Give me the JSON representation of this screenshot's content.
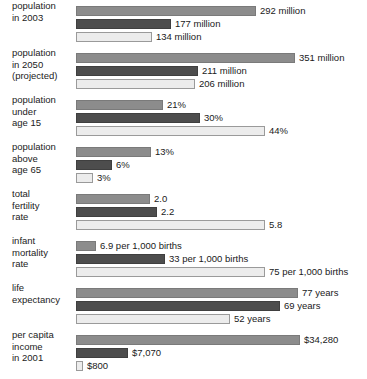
{
  "chart_data": {
    "type": "bar",
    "orientation": "horizontal",
    "title": "",
    "subtitle": "",
    "xlabel": "",
    "ylabel": "",
    "grid": false,
    "legend_position": "none",
    "series_names": [
      "United States",
      "World",
      "Least developed countries"
    ],
    "series_colors": [
      "#8c8c8c",
      "#4d4d4d",
      "#ececec"
    ],
    "categories": [
      "population in 2003",
      "population in 2050 (projected)",
      "population under age 15",
      "population above age 65",
      "total fertility rate",
      "infant mortality rate",
      "life expectancy",
      "per capita income in 2001"
    ],
    "series": [
      {
        "name": "United States",
        "values": [
          292,
          351,
          21,
          13,
          2.0,
          6.9,
          77,
          34280
        ]
      },
      {
        "name": "World",
        "values": [
          177,
          211,
          30,
          6,
          2.2,
          33,
          69,
          7070
        ]
      },
      {
        "name": "Least developed countries",
        "values": [
          134,
          206,
          44,
          3,
          5.8,
          75,
          52,
          800
        ]
      }
    ],
    "groups": [
      {
        "label_lines": [
          "population",
          "in 2003"
        ],
        "bars": [
          {
            "series": 0,
            "value": 292,
            "value_label": "292 million",
            "width_px": 180
          },
          {
            "series": 1,
            "value": 177,
            "value_label": "177 million",
            "width_px": 95
          },
          {
            "series": 2,
            "value": 134,
            "value_label": "134 million",
            "width_px": 76
          }
        ]
      },
      {
        "label_lines": [
          "population",
          "in 2050",
          "(projected)"
        ],
        "bars": [
          {
            "series": 0,
            "value": 351,
            "value_label": "351 million",
            "width_px": 219
          },
          {
            "series": 1,
            "value": 211,
            "value_label": "211 million",
            "width_px": 122
          },
          {
            "series": 2,
            "value": 206,
            "value_label": "206 million",
            "width_px": 119
          }
        ]
      },
      {
        "label_lines": [
          "population",
          "under",
          "age 15"
        ],
        "bars": [
          {
            "series": 0,
            "value": 21,
            "value_label": "21%",
            "width_px": 87
          },
          {
            "series": 1,
            "value": 30,
            "value_label": "30%",
            "width_px": 124
          },
          {
            "series": 2,
            "value": 44,
            "value_label": "44%",
            "width_px": 189
          }
        ]
      },
      {
        "label_lines": [
          "population",
          "above",
          "age 65"
        ],
        "bars": [
          {
            "series": 0,
            "value": 13,
            "value_label": "13%",
            "width_px": 75
          },
          {
            "series": 1,
            "value": 6,
            "value_label": "6%",
            "width_px": 36
          },
          {
            "series": 2,
            "value": 3,
            "value_label": "3%",
            "width_px": 17
          }
        ]
      },
      {
        "label_lines": [
          "total",
          "fertility",
          "rate"
        ],
        "bars": [
          {
            "series": 0,
            "value": 2.0,
            "value_label": "2.0",
            "width_px": 74
          },
          {
            "series": 1,
            "value": 2.2,
            "value_label": "2.2",
            "width_px": 81
          },
          {
            "series": 2,
            "value": 5.8,
            "value_label": "5.8",
            "width_px": 189
          }
        ]
      },
      {
        "label_lines": [
          "infant",
          "mortality",
          "rate"
        ],
        "bars": [
          {
            "series": 0,
            "value": 6.9,
            "value_label": "6.9 per 1,000 births",
            "width_px": 20
          },
          {
            "series": 1,
            "value": 33,
            "value_label": "33 per 1,000 births",
            "width_px": 89
          },
          {
            "series": 2,
            "value": 75,
            "value_label": "75 per 1,000 births",
            "width_px": 189
          }
        ]
      },
      {
        "label_lines": [
          "life",
          "expectancy"
        ],
        "bars": [
          {
            "series": 0,
            "value": 77,
            "value_label": "77 years",
            "width_px": 222
          },
          {
            "series": 1,
            "value": 69,
            "value_label": "69 years",
            "width_px": 204
          },
          {
            "series": 2,
            "value": 52,
            "value_label": "52 years",
            "width_px": 154
          }
        ]
      },
      {
        "label_lines": [
          "per capita",
          "income",
          "in 2001"
        ],
        "bars": [
          {
            "series": 0,
            "value": 34280,
            "value_label": "$34,280",
            "width_px": 224
          },
          {
            "series": 1,
            "value": 7070,
            "value_label": "$7,070",
            "width_px": 52
          },
          {
            "series": 2,
            "value": 800,
            "value_label": "$800",
            "width_px": 7
          }
        ]
      }
    ]
  }
}
